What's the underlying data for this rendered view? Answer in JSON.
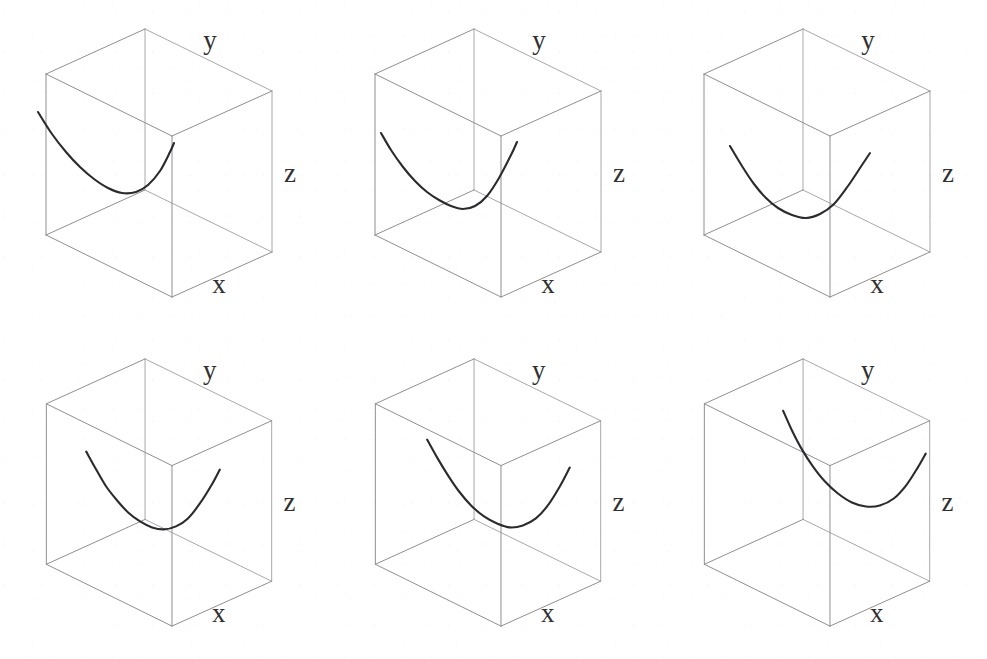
{
  "figure": {
    "title": "",
    "panel_count": 6,
    "rows": 2,
    "columns": 3,
    "background_color": "#ffffff",
    "cube_edge_color": "#8f8f92",
    "curve_color": "#2b2b2f",
    "label_color": "#303030"
  },
  "axis_labels": {
    "x": "x",
    "y": "y",
    "z": "z"
  },
  "chart_data": {
    "type": "line",
    "title": "",
    "xlabel": "x",
    "ylabel": "y",
    "zlabel": "z",
    "grid": false,
    "legend": "none",
    "projection": "3d-wireframe-box",
    "panels": [
      {
        "index": 1,
        "label_x": "x",
        "label_y": "y",
        "label_z": "z",
        "curve_type": "parabola",
        "cube": {
          "front_bottom_left": [
            46,
            235
          ],
          "front_bottom_right": [
            172,
            297
          ],
          "front_top_left": [
            46,
            74
          ],
          "front_top_right": [
            172,
            136
          ],
          "back_bottom_left": [
            145,
            190
          ],
          "back_bottom_right": [
            272,
            252
          ],
          "back_top_left": [
            145,
            29
          ],
          "back_top_right": [
            272,
            91
          ]
        },
        "curve_points": [
          [
            38,
            112
          ],
          [
            52,
            134
          ],
          [
            66,
            152
          ],
          [
            80,
            167
          ],
          [
            94,
            179
          ],
          [
            108,
            188
          ],
          [
            122,
            193
          ],
          [
            136,
            192
          ],
          [
            148,
            185
          ],
          [
            160,
            171
          ],
          [
            170,
            152
          ],
          [
            174,
            143
          ]
        ],
        "start_point": [
          38,
          112
        ],
        "vertex_point": [
          124,
          193
        ],
        "end_point": [
          174,
          143
        ]
      },
      {
        "index": 2,
        "label_x": "x",
        "label_y": "y",
        "label_z": "z",
        "curve_type": "parabola",
        "cube": {
          "front_bottom_left": [
            46,
            235
          ],
          "front_bottom_right": [
            172,
            297
          ],
          "front_top_left": [
            46,
            74
          ],
          "front_top_right": [
            172,
            136
          ],
          "back_bottom_left": [
            145,
            190
          ],
          "back_bottom_right": [
            272,
            252
          ],
          "back_top_left": [
            145,
            29
          ],
          "back_top_right": [
            272,
            91
          ]
        },
        "curve_points": [
          [
            52,
            133
          ],
          [
            62,
            150
          ],
          [
            74,
            167
          ],
          [
            86,
            181
          ],
          [
            98,
            192
          ],
          [
            110,
            200
          ],
          [
            122,
            206
          ],
          [
            134,
            209
          ],
          [
            146,
            206
          ],
          [
            158,
            196
          ],
          [
            170,
            178
          ],
          [
            182,
            155
          ],
          [
            188,
            142
          ]
        ],
        "start_point": [
          52,
          133
        ],
        "vertex_point": [
          132,
          209
        ],
        "end_point": [
          188,
          142
        ]
      },
      {
        "index": 3,
        "label_x": "x",
        "label_y": "y",
        "label_z": "z",
        "curve_type": "parabola",
        "cube": {
          "front_bottom_left": [
            46,
            235
          ],
          "front_bottom_right": [
            172,
            297
          ],
          "front_top_left": [
            46,
            74
          ],
          "front_top_right": [
            172,
            136
          ],
          "back_bottom_left": [
            145,
            190
          ],
          "back_bottom_right": [
            272,
            252
          ],
          "back_top_left": [
            145,
            29
          ],
          "back_top_right": [
            272,
            91
          ]
        },
        "curve_points": [
          [
            72,
            146
          ],
          [
            84,
            166
          ],
          [
            96,
            184
          ],
          [
            108,
            198
          ],
          [
            120,
            208
          ],
          [
            134,
            215
          ],
          [
            148,
            218
          ],
          [
            162,
            214
          ],
          [
            176,
            204
          ],
          [
            190,
            186
          ],
          [
            204,
            165
          ],
          [
            212,
            153
          ]
        ],
        "start_point": [
          72,
          146
        ],
        "vertex_point": [
          150,
          218
        ],
        "end_point": [
          212,
          153
        ]
      },
      {
        "index": 4,
        "label_x": "x",
        "label_y": "y",
        "label_z": "z",
        "curve_type": "parabola",
        "cube": {
          "front_bottom_left": [
            46,
            235
          ],
          "front_bottom_right": [
            172,
            297
          ],
          "front_top_left": [
            46,
            74
          ],
          "front_top_right": [
            172,
            136
          ],
          "back_bottom_left": [
            145,
            190
          ],
          "back_bottom_right": [
            272,
            252
          ],
          "back_top_left": [
            145,
            29
          ],
          "back_top_right": [
            272,
            91
          ]
        },
        "curve_points": [
          [
            86,
            122
          ],
          [
            96,
            140
          ],
          [
            106,
            157
          ],
          [
            117,
            171
          ],
          [
            128,
            183
          ],
          [
            140,
            192
          ],
          [
            152,
            198
          ],
          [
            164,
            200
          ],
          [
            176,
            197
          ],
          [
            188,
            189
          ],
          [
            200,
            174
          ],
          [
            212,
            155
          ],
          [
            220,
            140
          ]
        ],
        "start_point": [
          86,
          122
        ],
        "vertex_point": [
          162,
          200
        ],
        "end_point": [
          220,
          140
        ]
      },
      {
        "index": 5,
        "label_x": "x",
        "label_y": "y",
        "label_z": "z",
        "curve_type": "parabola",
        "cube": {
          "front_bottom_left": [
            46,
            235
          ],
          "front_bottom_right": [
            172,
            297
          ],
          "front_top_left": [
            46,
            74
          ],
          "front_top_right": [
            172,
            136
          ],
          "back_bottom_left": [
            145,
            190
          ],
          "back_bottom_right": [
            272,
            252
          ],
          "back_top_left": [
            145,
            29
          ],
          "back_top_right": [
            272,
            91
          ]
        },
        "curve_points": [
          [
            98,
            110
          ],
          [
            108,
            128
          ],
          [
            119,
            146
          ],
          [
            130,
            162
          ],
          [
            142,
            176
          ],
          [
            155,
            187
          ],
          [
            168,
            194
          ],
          [
            181,
            198
          ],
          [
            194,
            196
          ],
          [
            207,
            189
          ],
          [
            219,
            176
          ],
          [
            231,
            157
          ],
          [
            241,
            138
          ]
        ],
        "start_point": [
          98,
          110
        ],
        "vertex_point": [
          180,
          198
        ],
        "end_point": [
          241,
          138
        ]
      },
      {
        "index": 6,
        "label_x": "x",
        "label_y": "y",
        "label_z": "z",
        "curve_type": "parabola",
        "cube": {
          "front_bottom_left": [
            46,
            235
          ],
          "front_bottom_right": [
            172,
            297
          ],
          "front_top_left": [
            46,
            74
          ],
          "front_top_right": [
            172,
            136
          ],
          "back_bottom_left": [
            145,
            190
          ],
          "back_bottom_right": [
            272,
            252
          ],
          "back_top_left": [
            145,
            29
          ],
          "back_top_right": [
            272,
            91
          ]
        },
        "curve_points": [
          [
            125,
            81
          ],
          [
            134,
            101
          ],
          [
            144,
            120
          ],
          [
            155,
            137
          ],
          [
            167,
            152
          ],
          [
            180,
            164
          ],
          [
            194,
            173
          ],
          [
            208,
            177
          ],
          [
            222,
            176
          ],
          [
            236,
            169
          ],
          [
            249,
            155
          ],
          [
            260,
            138
          ],
          [
            268,
            124
          ]
        ],
        "start_point": [
          125,
          81
        ],
        "vertex_point": [
          212,
          177
        ],
        "end_point": [
          268,
          124
        ]
      }
    ]
  }
}
